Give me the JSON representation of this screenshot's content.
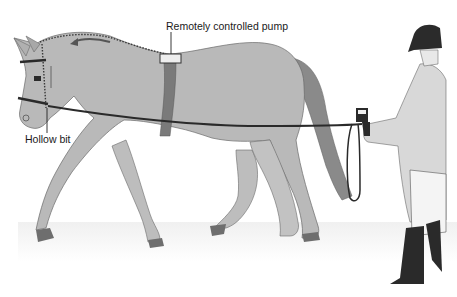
{
  "diagram": {
    "labels": {
      "pump": "Remotely controlled pump",
      "bit": "Hollow bit"
    },
    "elements": {
      "horse": "horse-trotting",
      "handler": "handler-with-remote",
      "girth_strap": "girth-strap",
      "lunge_line": "lunge-line",
      "airflow_arrow": "airflow-arrow"
    },
    "colors": {
      "horse_body": "#b9b9b9",
      "horse_outline": "#6a6a6a",
      "tail": "#8a8a8a",
      "strap": "#7a7a7a",
      "pump_box": "#eeeeee",
      "line": "#2a2a2a",
      "hoof": "#6e6e6e",
      "jacket": "#d8d8d8",
      "helmet": "#2b2b2b",
      "boots": "#2a2a2a",
      "ground": "#f0f0f0"
    }
  }
}
